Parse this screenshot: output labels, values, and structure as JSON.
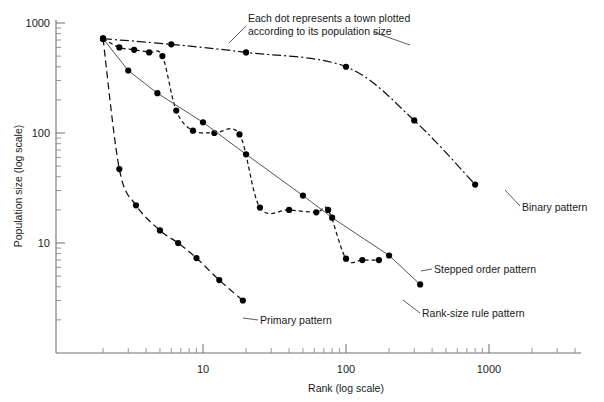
{
  "chart_data": {
    "type": "line",
    "title": "",
    "xlabel": "Rank (log scale)",
    "ylabel": "Population size (log scale)",
    "xscale": "log",
    "yscale": "log",
    "xlim": [
      2,
      4000
    ],
    "ylim": [
      2,
      1000
    ],
    "xticks": [
      10,
      100,
      1000
    ],
    "xticklabels": [
      "10",
      "100",
      "1000"
    ],
    "yticks": [
      10,
      100,
      1000
    ],
    "yticklabels": [
      "10",
      "100",
      "1000"
    ],
    "grid": false,
    "legend_position": "inline-annotations",
    "annotations": [
      {
        "name": "dot-meaning-note",
        "line1": "Each dot represents a town plotted",
        "line2": "according to its population size"
      }
    ],
    "series": [
      {
        "name": "Binary pattern",
        "label": "Binary pattern",
        "linestyle": "dash-dot",
        "marker": "filled-circle",
        "points": [
          {
            "rank": 2.0,
            "population": 720
          },
          {
            "rank": 6.0,
            "population": 640
          },
          {
            "rank": 20.0,
            "population": 540
          },
          {
            "rank": 100,
            "population": 400
          },
          {
            "rank": 300,
            "population": 130
          },
          {
            "rank": 800,
            "population": 34
          }
        ]
      },
      {
        "name": "Stepped order pattern",
        "label": "Stepped order pattern",
        "linestyle": "dashed",
        "marker": "filled-circle",
        "points": [
          {
            "rank": 2.0,
            "population": 720
          },
          {
            "rank": 2.6,
            "population": 600
          },
          {
            "rank": 3.3,
            "population": 570
          },
          {
            "rank": 4.2,
            "population": 540
          },
          {
            "rank": 5.2,
            "population": 500
          },
          {
            "rank": 6.5,
            "population": 160
          },
          {
            "rank": 8.5,
            "population": 105
          },
          {
            "rank": 12,
            "population": 100
          },
          {
            "rank": 18,
            "population": 97
          },
          {
            "rank": 25,
            "population": 21
          },
          {
            "rank": 40,
            "population": 20
          },
          {
            "rank": 62,
            "population": 19
          },
          {
            "rank": 75,
            "population": 20
          },
          {
            "rank": 100,
            "population": 7.2
          },
          {
            "rank": 130,
            "population": 7.0
          },
          {
            "rank": 170,
            "population": 7.0
          }
        ]
      },
      {
        "name": "Rank-size rule pattern",
        "label": "Rank-size rule pattern",
        "linestyle": "solid",
        "marker": "filled-circle",
        "points": [
          {
            "rank": 2.0,
            "population": 720
          },
          {
            "rank": 3.0,
            "population": 370
          },
          {
            "rank": 4.8,
            "population": 230
          },
          {
            "rank": 10,
            "population": 125
          },
          {
            "rank": 20,
            "population": 64
          },
          {
            "rank": 50,
            "population": 27
          },
          {
            "rank": 80,
            "population": 17
          },
          {
            "rank": 200,
            "population": 7.7
          },
          {
            "rank": 330,
            "population": 4.2
          }
        ]
      },
      {
        "name": "Primary pattern",
        "label": "Primary pattern",
        "linestyle": "long-dashed",
        "marker": "filled-circle",
        "points": [
          {
            "rank": 2.0,
            "population": 720
          },
          {
            "rank": 2.6,
            "population": 47
          },
          {
            "rank": 3.4,
            "population": 22
          },
          {
            "rank": 5.0,
            "population": 13
          },
          {
            "rank": 6.7,
            "population": 10
          },
          {
            "rank": 9.0,
            "population": 7.3
          },
          {
            "rank": 13,
            "population": 4.6
          },
          {
            "rank": 19,
            "population": 3.0
          }
        ]
      }
    ]
  },
  "axis": {
    "x_title": "Rank (log scale)",
    "y_title": "Population size (log scale)",
    "x_labels": [
      "10",
      "100",
      "1000"
    ],
    "y_labels": [
      "1000",
      "100",
      "10"
    ]
  },
  "labels": {
    "binary": "Binary pattern",
    "stepped": "Stepped order pattern",
    "ranksize": "Rank-size rule pattern",
    "primary": "Primary pattern",
    "note_line1": "Each dot represents a town plotted",
    "note_line2": "according to its population size"
  },
  "colors": {
    "ink": "#111111",
    "axis": "#6f6f6f",
    "solid_line": "#555555",
    "background": "#ffffff"
  }
}
